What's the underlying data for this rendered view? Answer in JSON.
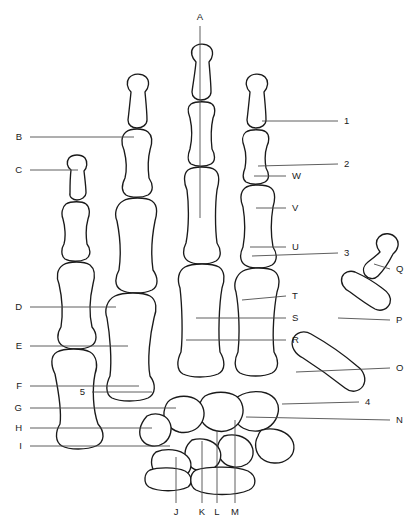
{
  "figure": {
    "kind": "anatomical-line-diagram",
    "view": "dorsal-right-hand",
    "background_color": "#ffffff",
    "line_color": "#1a1a1a",
    "leader_color": "#4d4d4d",
    "width": 419,
    "height": 529
  },
  "labels": {
    "top": [
      {
        "id": "A",
        "text": "A",
        "x": 200,
        "y": 17,
        "anchor": "center",
        "leader": {
          "x1": 200,
          "y1": 26,
          "x2": 200,
          "y2": 218
        }
      }
    ],
    "left": [
      {
        "id": "B",
        "text": "B",
        "x": 22,
        "y": 137,
        "anchor": "left",
        "leader": {
          "x1": 30,
          "y1": 137,
          "x2": 134,
          "y2": 137
        }
      },
      {
        "id": "C",
        "text": "C",
        "x": 22,
        "y": 170,
        "anchor": "left",
        "leader": {
          "x1": 30,
          "y1": 170,
          "x2": 78,
          "y2": 170
        }
      },
      {
        "id": "D",
        "text": "D",
        "x": 22,
        "y": 307,
        "anchor": "left",
        "leader": {
          "x1": 30,
          "y1": 307,
          "x2": 116,
          "y2": 307
        }
      },
      {
        "id": "E",
        "text": "E",
        "x": 22,
        "y": 346,
        "anchor": "left",
        "leader": {
          "x1": 30,
          "y1": 346,
          "x2": 128,
          "y2": 346
        }
      },
      {
        "id": "F",
        "text": "F",
        "x": 22,
        "y": 386,
        "anchor": "left",
        "leader": {
          "x1": 30,
          "y1": 386,
          "x2": 139,
          "y2": 386
        }
      },
      {
        "id": "5",
        "text": "5",
        "x": 85,
        "y": 392,
        "anchor": "left",
        "leader": {
          "x1": 92,
          "y1": 392,
          "x2": 152,
          "y2": 392
        }
      },
      {
        "id": "G",
        "text": "G",
        "x": 22,
        "y": 408,
        "anchor": "left",
        "leader": {
          "x1": 30,
          "y1": 408,
          "x2": 176,
          "y2": 408
        }
      },
      {
        "id": "H",
        "text": "H",
        "x": 22,
        "y": 428,
        "anchor": "left",
        "leader": {
          "x1": 30,
          "y1": 428,
          "x2": 152,
          "y2": 428
        }
      },
      {
        "id": "I",
        "text": "I",
        "x": 22,
        "y": 446,
        "anchor": "left",
        "leader": {
          "x1": 30,
          "y1": 446,
          "x2": 170,
          "y2": 446
        }
      }
    ],
    "bottom": [
      {
        "id": "J",
        "text": "J",
        "x": 176,
        "y": 512,
        "anchor": "center",
        "leader": {
          "x1": 176,
          "y1": 503,
          "x2": 176,
          "y2": 457
        }
      },
      {
        "id": "K",
        "text": "K",
        "x": 202,
        "y": 512,
        "anchor": "center",
        "leader": {
          "x1": 202,
          "y1": 503,
          "x2": 202,
          "y2": 441
        }
      },
      {
        "id": "L",
        "text": "L",
        "x": 217,
        "y": 512,
        "anchor": "center",
        "leader": {
          "x1": 217,
          "y1": 503,
          "x2": 217,
          "y2": 430
        }
      },
      {
        "id": "M",
        "text": "M",
        "x": 235,
        "y": 512,
        "anchor": "center",
        "leader": {
          "x1": 235,
          "y1": 503,
          "x2": 235,
          "y2": 420
        }
      }
    ],
    "right": [
      {
        "id": "1",
        "text": "1",
        "x": 344,
        "y": 121,
        "anchor": "right",
        "leader": {
          "x1": 338,
          "y1": 121,
          "x2": 262,
          "y2": 121
        }
      },
      {
        "id": "2",
        "text": "2",
        "x": 344,
        "y": 164,
        "anchor": "right",
        "leader": {
          "x1": 338,
          "y1": 164,
          "x2": 258,
          "y2": 166
        }
      },
      {
        "id": "W",
        "text": "W",
        "x": 292,
        "y": 176,
        "anchor": "right",
        "leader": {
          "x1": 286,
          "y1": 176,
          "x2": 254,
          "y2": 176
        }
      },
      {
        "id": "V",
        "text": "V",
        "x": 292,
        "y": 208,
        "anchor": "right",
        "leader": {
          "x1": 286,
          "y1": 208,
          "x2": 256,
          "y2": 208
        }
      },
      {
        "id": "U",
        "text": "U",
        "x": 292,
        "y": 247,
        "anchor": "right",
        "leader": {
          "x1": 286,
          "y1": 247,
          "x2": 250,
          "y2": 247
        }
      },
      {
        "id": "3",
        "text": "3",
        "x": 344,
        "y": 253,
        "anchor": "right",
        "leader": {
          "x1": 338,
          "y1": 253,
          "x2": 252,
          "y2": 256
        }
      },
      {
        "id": "Q",
        "text": "Q",
        "x": 396,
        "y": 269,
        "anchor": "right",
        "leader": {
          "x1": 390,
          "y1": 269,
          "x2": 374,
          "y2": 264
        }
      },
      {
        "id": "T",
        "text": "T",
        "x": 292,
        "y": 296,
        "anchor": "right",
        "leader": {
          "x1": 286,
          "y1": 296,
          "x2": 242,
          "y2": 300
        }
      },
      {
        "id": "S",
        "text": "S",
        "x": 292,
        "y": 318,
        "anchor": "right",
        "leader": {
          "x1": 286,
          "y1": 318,
          "x2": 196,
          "y2": 318
        }
      },
      {
        "id": "P",
        "text": "P",
        "x": 396,
        "y": 320,
        "anchor": "right",
        "leader": {
          "x1": 390,
          "y1": 320,
          "x2": 338,
          "y2": 318
        }
      },
      {
        "id": "R",
        "text": "R",
        "x": 292,
        "y": 340,
        "anchor": "right",
        "leader": {
          "x1": 286,
          "y1": 340,
          "x2": 186,
          "y2": 340
        }
      },
      {
        "id": "O",
        "text": "O",
        "x": 396,
        "y": 368,
        "anchor": "right",
        "leader": {
          "x1": 390,
          "y1": 368,
          "x2": 296,
          "y2": 372
        }
      },
      {
        "id": "4",
        "text": "4",
        "x": 365,
        "y": 402,
        "anchor": "right",
        "leader": {
          "x1": 359,
          "y1": 402,
          "x2": 282,
          "y2": 404
        }
      },
      {
        "id": "N",
        "text": "N",
        "x": 396,
        "y": 420,
        "anchor": "right",
        "leader": {
          "x1": 390,
          "y1": 420,
          "x2": 246,
          "y2": 417
        }
      }
    ]
  },
  "bones": {
    "index_finger": {
      "distal_phalanx": "M196,62 C192,58 190,52 193,48 C197,43 206,43 210,47 C214,51 213,58 209,62 C210,74 211,84 211,92 C211,97 206,100 201,100 C196,100 192,97 192,92 C193,84 195,73 196,62 Z",
      "middle_phalanx": "M191,104 C196,101 208,101 212,104 C216,107 215,114 213,118 C211,127 211,140 212,149 C215,154 216,161 211,164 C206,167 196,167 191,164 C187,161 188,154 190,149 C192,140 192,127 190,118 C188,113 187,107 191,104 Z",
      "proximal_phalanx": "M188,170 C194,166 210,166 215,170 C220,174 219,183 217,190 C215,205 215,228 217,243 C221,249 222,257 216,261 C209,265 194,265 188,261 C182,257 183,249 186,243 C189,228 189,205 187,190 C184,183 183,174 188,170 Z",
      "metacarpal": "M185,267 C192,263 212,263 219,267 C225,271 225,280 222,288 C219,305 218,335 220,352 C225,360 226,370 218,374 C209,378 191,378 183,374 C176,370 177,360 181,352 C183,335 182,305 180,288 C177,280 178,271 185,267 Z"
    },
    "middle_finger": {
      "distal_phalanx": "M250,92 C246,88 245,82 248,78 C252,73 261,73 265,77 C269,81 268,88 264,92 C265,103 266,112 266,120 C266,125 261,128 256,128 C251,128 247,125 247,120 C248,112 249,102 250,92 Z",
      "middle_phalanx": "M246,132 C251,129 262,129 266,132 C270,135 269,142 267,146 C265,152 265,162 266,168 C269,173 270,179 265,182 C260,185 251,185 246,182 C242,179 243,173 245,168 C246,162 246,152 244,146 C242,141 242,135 246,132 Z",
      "proximal_phalanx": "M245,188 C250,184 266,184 271,188 C276,192 275,200 273,207 C271,219 271,236 273,247 C277,253 278,261 272,265 C265,269 251,269 245,265 C239,261 240,253 243,247 C245,236 245,219 243,207 C240,200 240,192 245,188 Z",
      "metacarpal": "M243,271 C250,267 268,267 274,271 C280,275 280,284 277,292 C274,308 272,334 274,352 C279,360 279,369 272,373 C264,377 247,377 240,373 C234,369 234,360 238,352 C240,334 239,308 236,292 C233,284 236,275 243,271 Z"
    },
    "ring_finger": {
      "distal_phalanx": "M131,92 C127,88 126,82 129,78 C133,73 142,73 146,77 C150,81 149,88 145,92 C146,103 147,112 147,120 C147,125 142,128 137,128 C132,128 128,125 128,120 C129,112 130,102 131,92 Z",
      "middle_phalanx": "M126,132 C131,128 143,128 148,132 C153,136 152,144 150,150 C148,158 148,170 149,178 C153,184 154,191 148,195 C142,198 131,198 126,195 C121,191 122,184 125,178 C127,170 126,158 124,150 C121,144 121,136 126,132 Z",
      "proximal_phalanx": "M123,201 C129,197 146,197 152,201 C158,205 157,214 155,221 C152,236 151,256 153,270 C158,277 159,286 152,290 C144,294 128,294 121,290 C114,286 115,277 119,270 C121,256 120,236 117,221 C114,214 116,205 123,201 Z",
      "metacarpal": "M115,296 C123,292 143,292 150,296 C157,300 157,310 154,318 C150,335 147,360 150,376 C156,384 156,394 148,398 C139,402 120,402 112,398 C105,394 106,384 110,376 C112,360 110,335 107,318 C104,310 107,300 115,296 Z"
    },
    "little_finger": {
      "distal_phalanx": "M71,170 C67,167 66,162 69,158 C73,154 81,154 85,158 C88,162 87,168 84,171 C85,180 86,187 86,193 C86,197 81,200 77,200 C73,200 69,197 70,193 C70,187 70,178 71,170 Z",
      "middle_phalanx": "M66,204 C71,201 82,201 86,204 C90,207 90,214 88,219 C86,226 86,237 87,244 C91,249 91,256 86,259 C80,262 70,262 65,259 C61,256 61,249 64,244 C66,237 65,226 63,219 C61,214 62,207 66,204 Z",
      "proximal_phalanx": "M63,265 C69,261 84,261 90,265 C95,269 95,277 93,284 C90,297 89,314 92,327 C97,333 98,342 91,346 C84,350 69,350 63,346 C56,342 57,333 61,327 C63,314 62,297 59,284 C56,277 57,269 63,265 Z",
      "metacarpal": "M57,352 C64,348 83,348 90,352 C97,356 98,366 95,374 C92,389 93,410 98,424 C105,432 105,442 96,446 C87,450 69,450 62,446 C55,442 55,432 60,424 C62,410 58,389 55,374 C51,366 50,356 57,352 Z"
    },
    "thumb": {
      "distal_phalanx": "M380,252 C376,247 375,241 379,237 C384,232 392,233 396,238 C400,243 398,250 393,254 C389,262 384,270 378,276 C374,280 368,279 365,275 C362,270 364,265 368,262 C372,259 376,256 380,252 Z",
      "proximal_phalanx": "M350,292 C344,289 340,283 342,277 C344,272 350,270 355,272 C364,276 374,282 382,288 C388,292 392,297 390,303 C388,309 381,312 375,309 C366,304 358,298 350,292 Z",
      "metacarpal": "M303,358 C295,354 290,346 293,339 C296,332 304,330 311,334 C327,343 343,354 357,366 C364,371 367,379 363,386 C359,392 351,393 345,388 C331,377 317,367 303,358 Z"
    },
    "carpals": {
      "scaphoid": "M236,398 C244,392 256,390 266,393 C275,396 280,404 278,413 C276,423 268,430 258,431 C247,432 238,427 234,418 C231,410 231,403 236,398 Z",
      "lunate": "M205,396 C214,391 228,391 236,396 C243,401 245,411 241,419 C237,428 227,433 217,431 C206,429 199,421 199,411 C199,404 201,399 205,396 Z",
      "triquetrum": "M170,400 C178,395 190,395 197,400 C204,405 206,414 202,422 C198,430 188,434 179,432 C169,429 163,421 164,412 C165,406 167,402 170,400 Z",
      "pisiform": "M147,416 C155,412 165,414 169,421 C173,428 171,438 164,443 C157,448 147,447 142,440 C138,434 139,425 147,416 Z",
      "trapezium": "M262,430 C272,427 284,430 290,437 C296,444 295,454 288,459 C280,465 268,464 261,458 C255,452 254,443 258,436 C259,433 260,431 262,430 Z",
      "trapezoid": "M224,436 C234,433 245,436 250,443 C255,450 254,459 247,464 C239,469 228,468 222,461 C216,454 216,444 222,438 Z",
      "capitate": "M192,440 C202,437 213,440 218,447 C223,454 221,463 214,468 C206,473 195,472 189,465 C183,458 184,448 190,442 Z",
      "hamate": "M156,452 C166,448 180,449 187,456 C193,462 192,471 185,476 C176,481 163,480 156,473 C150,467 150,457 156,452 Z"
    },
    "radius_ulna": {
      "ulna": "M150,470 C158,467 176,467 185,471 C192,475 193,483 188,487 C178,492 158,492 149,487 C143,483 144,473 150,470 Z",
      "radius": "M196,470 C208,466 236,466 248,471 C257,476 257,486 249,490 C236,496 208,496 196,490 C189,486 189,474 196,470 Z"
    }
  }
}
